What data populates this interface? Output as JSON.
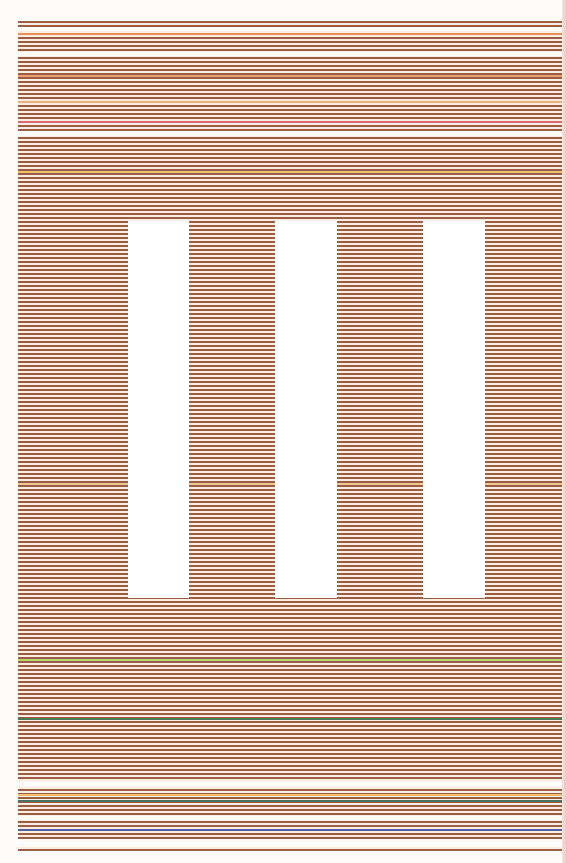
{
  "artwork": {
    "description": "Horizontal striped composition with three vertical white bars",
    "stripe_color": "#9a5d45",
    "ground_color": "#fbeee0",
    "canvas": {
      "left": 18,
      "top": 21,
      "width": 545,
      "height": 830
    },
    "white_bars": [
      {
        "left": 110,
        "top": 200,
        "width": 61,
        "height": 377
      },
      {
        "left": 257,
        "top": 200,
        "width": 62,
        "height": 377
      },
      {
        "left": 405,
        "top": 200,
        "width": 62,
        "height": 377
      }
    ],
    "gaps": [
      {
        "top": 6,
        "height": 4
      },
      {
        "top": 31,
        "height": 4
      },
      {
        "top": 110,
        "height": 5
      },
      {
        "top": 760,
        "height": 6
      },
      {
        "top": 795,
        "height": 4
      },
      {
        "top": 818,
        "height": 8
      }
    ],
    "accent_lines": [
      {
        "top": 12,
        "color": "#e8905a"
      },
      {
        "top": 54,
        "color": "#f0a070"
      },
      {
        "top": 80,
        "color": "#e8b080"
      },
      {
        "top": 100,
        "color": "#d86a78"
      },
      {
        "top": 150,
        "color": "#f0c070"
      },
      {
        "top": 462,
        "color": "#f0c890"
      },
      {
        "top": 638,
        "color": "#b8d870"
      },
      {
        "top": 697,
        "color": "#4a7a50"
      },
      {
        "top": 773,
        "color": "#f0c070"
      },
      {
        "top": 779,
        "color": "#4a7060"
      },
      {
        "top": 808,
        "color": "#5060a0"
      }
    ]
  }
}
